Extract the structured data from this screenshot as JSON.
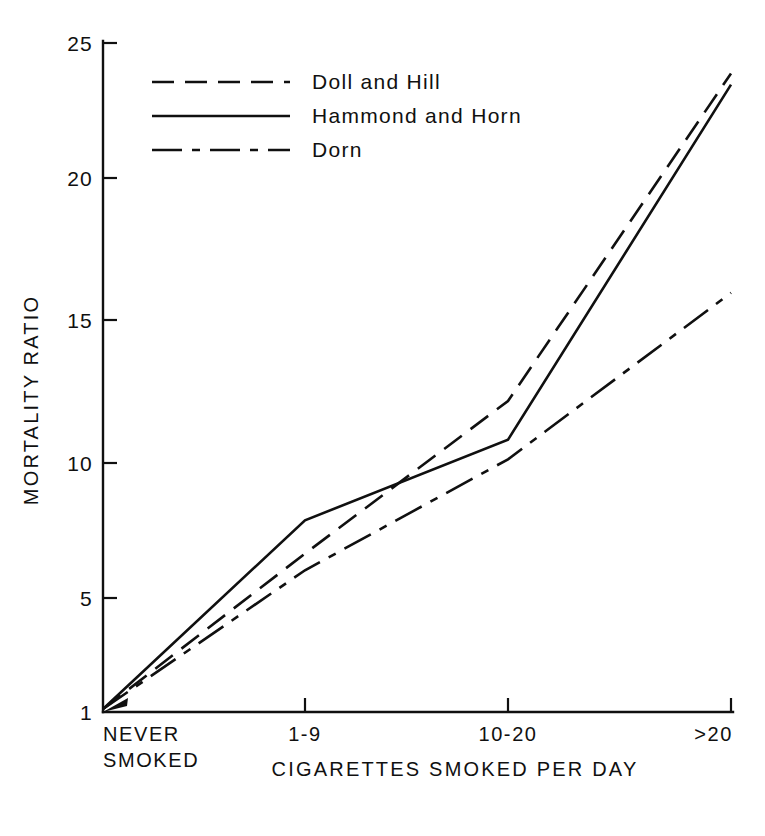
{
  "chart_data": {
    "type": "line",
    "title": "",
    "xlabel": "CIGARETTES SMOKED PER DAY",
    "ylabel": "MORTALITY RATIO",
    "categories": [
      "NEVER SMOKED",
      "1-9",
      "10-20",
      ">20"
    ],
    "category_labels": [
      {
        "line1": "NEVER",
        "line2": "SMOKED"
      },
      {
        "line1": "1-9",
        "line2": ""
      },
      {
        "line1": "10-20",
        "line2": ""
      },
      {
        "line1": ">20",
        "line2": ""
      }
    ],
    "ylim": [
      1,
      25
    ],
    "yticks": [
      1,
      5,
      10,
      15,
      20,
      25
    ],
    "ytick_labels": [
      "1",
      "5",
      "10",
      "15",
      "20",
      "25"
    ],
    "grid": false,
    "legend_position": "upper-left",
    "series": [
      {
        "name": "Doll and Hill",
        "style": "dashed",
        "values": [
          1.0,
          6.6,
          12.1,
          23.9
        ]
      },
      {
        "name": "Hammond and Horn",
        "style": "solid",
        "values": [
          1.0,
          7.8,
          10.7,
          23.5
        ]
      },
      {
        "name": "Dorn",
        "style": "dash-dot",
        "values": [
          1.0,
          6.0,
          10.0,
          16.0
        ]
      }
    ]
  },
  "legend": {
    "entries": [
      {
        "label": "Doll and Hill",
        "style": "dashed"
      },
      {
        "label": "Hammond and Horn",
        "style": "solid"
      },
      {
        "label": "Dorn",
        "style": "dash-dot"
      }
    ]
  },
  "axes": {
    "y_title": "MORTALITY RATIO",
    "x_title": "CIGARETTES SMOKED PER DAY"
  },
  "colors": {
    "ink": "#101010",
    "background": "#ffffff"
  }
}
